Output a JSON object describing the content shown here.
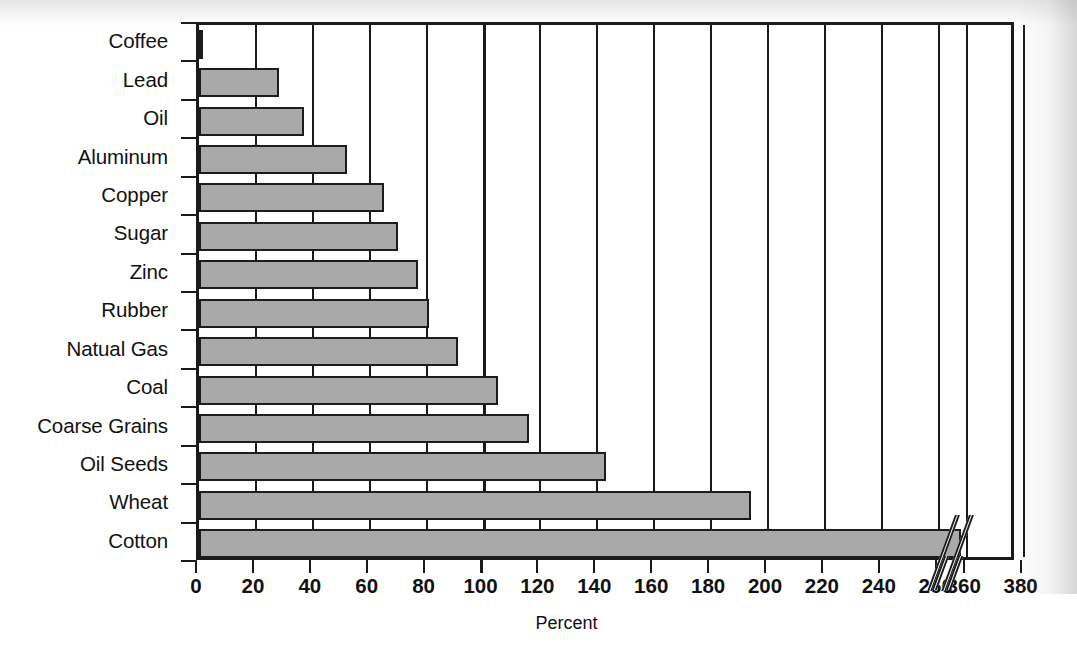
{
  "chart_data": {
    "type": "bar",
    "orientation": "horizontal",
    "title": "",
    "xlabel": "Percent",
    "ylabel": "",
    "xlim": [
      0,
      380
    ],
    "grid": true,
    "legend": false,
    "axis_break": {
      "present": true,
      "after_tick": 260,
      "before_tick": 360,
      "note": "broken x-axis between 260 and 360"
    },
    "xticks": [
      0,
      20,
      40,
      60,
      80,
      100,
      120,
      140,
      160,
      180,
      200,
      220,
      240,
      260,
      360,
      380
    ],
    "xticklabels": [
      "0",
      "20",
      "40",
      "60",
      "80",
      "100",
      "120",
      "140",
      "160",
      "180",
      "200",
      "220",
      "240",
      "260",
      "360",
      "380"
    ],
    "categories": [
      "Coffee",
      "Lead",
      "Oil",
      "Aluminum",
      "Copper",
      "Sugar",
      "Zinc",
      "Rubber",
      "Natual Gas",
      "Coal",
      "Coarse Grains",
      "Oil Seeds",
      "Wheat",
      "Cotton"
    ],
    "values": [
      1.5,
      28,
      37,
      52,
      65,
      70,
      77,
      81,
      91,
      105,
      116,
      143,
      194,
      358
    ],
    "bar_color": "#a9a9a9",
    "bar_edge_color": "#1c1c1c",
    "reference_line_at": 100
  },
  "axis": {
    "x_title": "Percent"
  }
}
